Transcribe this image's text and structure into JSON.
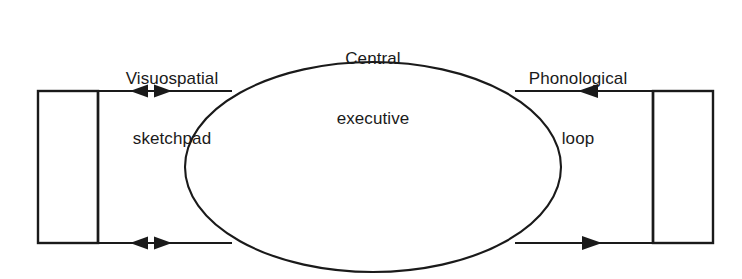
{
  "diagram": {
    "background_color": "#ffffff",
    "stroke_color": "#1a1a1a",
    "text_color": "#1a1a1a",
    "width": 742,
    "height": 279,
    "labels": {
      "visuospatial": {
        "line1": "Visuospatial",
        "line2": "sketchpad"
      },
      "central": {
        "line1": "Central",
        "line2": "executive"
      },
      "phonological": {
        "line1": "Phonological",
        "line2": "loop"
      }
    },
    "nodes": {
      "left_box": {
        "name": "visuospatial sketchpad store",
        "x": 38,
        "y": 91,
        "width": 60,
        "height": 152
      },
      "right_box": {
        "name": "phonological loop store",
        "x": 653,
        "y": 91,
        "width": 60,
        "height": 152
      },
      "ellipse": {
        "name": "central executive",
        "cx": 373,
        "cy": 167,
        "rx": 188,
        "ry": 105
      }
    },
    "connectors": [
      {
        "name": "top-left-connector",
        "side": "left",
        "position": "top",
        "y": 91,
        "from_x": 38,
        "to_x": 226,
        "arrowheads": "bidirectional",
        "marker_left_x": 141,
        "marker_right_x": 160
      },
      {
        "name": "bottom-left-connector",
        "side": "left",
        "position": "bottom",
        "y": 243,
        "from_x": 38,
        "to_x": 226,
        "arrowheads": "bidirectional",
        "marker_left_x": 141,
        "marker_right_x": 160
      },
      {
        "name": "top-right-connector",
        "side": "right",
        "position": "top",
        "y": 91,
        "from_x": 713,
        "to_x": 521,
        "arrowheads": "leftward",
        "marker_x": 590
      },
      {
        "name": "bottom-right-connector",
        "side": "right",
        "position": "bottom",
        "y": 243,
        "from_x": 521,
        "to_x": 713,
        "arrowheads": "rightward",
        "marker_x": 592
      }
    ]
  }
}
